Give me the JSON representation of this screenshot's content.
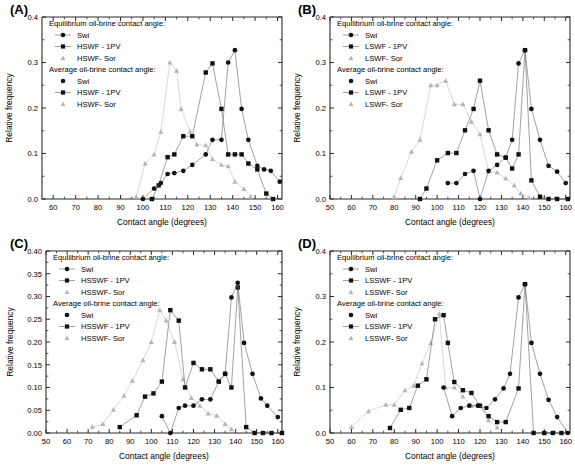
{
  "figure": {
    "panels": [
      "A",
      "B",
      "C",
      "D"
    ],
    "labels": {
      "A": "(A)",
      "B": "(B)",
      "C": "(C)",
      "D": "(D)"
    }
  },
  "chart_data": [
    {
      "panel": "(A)",
      "type": "line",
      "title": "",
      "xlabel": "Contact angle (degrees)",
      "ylabel": "Relative frequency",
      "xlim": [
        55,
        162
      ],
      "ylim": [
        0.0,
        0.4
      ],
      "xticks": [
        60,
        70,
        80,
        90,
        100,
        110,
        120,
        130,
        140,
        150,
        160
      ],
      "yticks": [
        0.0,
        0.1,
        0.2,
        0.3,
        0.4
      ],
      "ytick_labels": [
        "0.0",
        "0.1",
        "0.2",
        "0.3",
        "0.4"
      ],
      "grid": false,
      "legend_position": "upper-left",
      "legend_groups": [
        {
          "heading": "Equilibrium oil-brine contact angle:",
          "entries": [
            {
              "label": "Swi",
              "marker": "circle",
              "color": "#111111",
              "line": true
            },
            {
              "label": "HSWF - 1PV",
              "marker": "square",
              "color": "#111111",
              "line": true
            },
            {
              "label": "HSWF- Sor",
              "marker": "triangle",
              "color": "#b5b5b5",
              "line": false
            }
          ]
        },
        {
          "heading": "Average oil-brine contact angle:",
          "entries": [
            {
              "label": "Swi",
              "marker": "circle",
              "color": "#111111",
              "line": false
            },
            {
              "label": "HSWF - 1PV",
              "marker": "square",
              "color": "#111111",
              "line": true
            },
            {
              "label": "HSWF- Sor",
              "marker": "triangle",
              "color": "#b5b5b5",
              "line": false
            }
          ]
        }
      ],
      "series": [
        {
          "name": "Swi",
          "marker": "circle",
          "color": "#111111",
          "x": [
            100,
            105,
            108,
            111,
            114,
            118,
            122,
            128,
            131,
            135,
            138,
            141,
            144,
            147,
            151,
            154,
            157,
            161
          ],
          "values": [
            0.0,
            0.023,
            0.035,
            0.055,
            0.057,
            0.062,
            0.075,
            0.098,
            0.13,
            0.13,
            0.3,
            0.327,
            0.198,
            0.13,
            0.073,
            0.065,
            0.062,
            0.038
          ]
        },
        {
          "name": "HSWF - 1PV",
          "marker": "square",
          "color": "#111111",
          "x": [
            104,
            107,
            111,
            114,
            118,
            122,
            128,
            131,
            135,
            138,
            141,
            144,
            147,
            151,
            155,
            158
          ],
          "values": [
            0.0,
            0.03,
            0.092,
            0.098,
            0.138,
            0.138,
            0.278,
            0.298,
            0.198,
            0.098,
            0.098,
            0.098,
            0.078,
            0.065,
            0.012,
            0.0
          ]
        },
        {
          "name": "HSWF- Sor",
          "marker": "triangle",
          "color": "#b5b5b5",
          "x": [
            97,
            101,
            105,
            108,
            112,
            115,
            117,
            121,
            124,
            128,
            131,
            135,
            138,
            141,
            145,
            148
          ],
          "values": [
            0.005,
            0.078,
            0.098,
            0.148,
            0.3,
            0.282,
            0.198,
            0.148,
            0.12,
            0.118,
            0.088,
            0.075,
            0.072,
            0.038,
            0.022,
            0.005
          ]
        }
      ]
    },
    {
      "panel": "(B)",
      "type": "line",
      "title": "",
      "xlabel": "Contact angle (degrees)",
      "ylabel": "Relative frequency",
      "xlim": [
        50,
        162
      ],
      "ylim": [
        0.0,
        0.4
      ],
      "xticks": [
        50,
        60,
        70,
        80,
        90,
        100,
        110,
        120,
        130,
        140,
        150,
        160
      ],
      "yticks": [
        0.0,
        0.1,
        0.2,
        0.3,
        0.4
      ],
      "ytick_labels": [
        "0.0",
        "0.1",
        "0.2",
        "0.3",
        "0.4"
      ],
      "grid": false,
      "legend_position": "upper-left",
      "legend_groups": [
        {
          "heading": "Equilibrium oil-brine contact angle:",
          "entries": [
            {
              "label": "Swi",
              "marker": "circle",
              "color": "#111111",
              "line": true
            },
            {
              "label": "LSWF - 1PV",
              "marker": "square",
              "color": "#111111",
              "line": true
            },
            {
              "label": "LSWF- Sor",
              "marker": "triangle",
              "color": "#b5b5b5",
              "line": false
            }
          ]
        },
        {
          "heading": "Average oil-brine contact angle:",
          "entries": [
            {
              "label": "Swi",
              "marker": "circle",
              "color": "#111111",
              "line": false
            },
            {
              "label": "LSWF - 1PV",
              "marker": "square",
              "color": "#111111",
              "line": true
            },
            {
              "label": "LSWF- Sor",
              "marker": "triangle",
              "color": "#b5b5b5",
              "line": false
            }
          ]
        }
      ],
      "series": [
        {
          "name": "Swi",
          "marker": "circle",
          "color": "#111111",
          "x": [
            105,
            109,
            113,
            117,
            120,
            124,
            128,
            132,
            135,
            138,
            141,
            144,
            148,
            152,
            156,
            160
          ],
          "values": [
            0.035,
            0.035,
            0.055,
            0.062,
            0.0,
            0.062,
            0.075,
            0.091,
            0.13,
            0.298,
            0.327,
            0.198,
            0.13,
            0.073,
            0.06,
            0.035
          ]
        },
        {
          "name": "LSWF - 1PV",
          "marker": "square",
          "color": "#111111",
          "x": [
            92,
            95,
            100,
            105,
            109,
            113,
            117,
            120,
            124,
            128,
            132,
            135,
            138,
            141,
            144,
            148,
            152,
            156,
            161
          ],
          "values": [
            0.0,
            0.023,
            0.085,
            0.101,
            0.101,
            0.151,
            0.198,
            0.26,
            0.151,
            0.098,
            0.091,
            0.067,
            0.098,
            0.327,
            0.041,
            0.005,
            0.0,
            0.0,
            0.0
          ]
        },
        {
          "name": "LSWF- Sor",
          "marker": "triangle",
          "color": "#b5b5b5",
          "x": [
            80,
            83,
            88,
            92,
            97,
            100,
            104,
            108,
            112,
            116,
            120,
            124,
            128,
            132,
            136,
            139,
            143
          ],
          "values": [
            0.004,
            0.046,
            0.104,
            0.13,
            0.25,
            0.25,
            0.26,
            0.208,
            0.208,
            0.17,
            0.142,
            0.06,
            0.058,
            0.045,
            0.03,
            0.012,
            0.002
          ]
        }
      ]
    },
    {
      "panel": "(C)",
      "type": "line",
      "title": "",
      "xlabel": "Contact angle (degrees)",
      "ylabel": "Relative frequency",
      "xlim": [
        50,
        162
      ],
      "ylim": [
        0.0,
        0.4
      ],
      "xticks": [
        50,
        60,
        70,
        80,
        90,
        100,
        110,
        120,
        130,
        140,
        150,
        160
      ],
      "yticks": [
        0.0,
        0.05,
        0.1,
        0.15,
        0.2,
        0.25,
        0.3,
        0.35,
        0.4
      ],
      "ytick_labels": [
        "0.00",
        "0.05",
        "0.10",
        "0.15",
        "0.20",
        "0.25",
        "0.30",
        "0.35",
        "0.40"
      ],
      "grid": false,
      "legend_position": "upper-left",
      "legend_groups": [
        {
          "heading": "Equilibrium oil-brine contact angle:",
          "entries": [
            {
              "label": "Swi",
              "marker": "circle",
              "color": "#111111",
              "line": true
            },
            {
              "label": "HSSWF - 1PV",
              "marker": "square",
              "color": "#111111",
              "line": true
            },
            {
              "label": "HSSWF- Sor",
              "marker": "triangle",
              "color": "#b5b5b5",
              "line": false
            }
          ]
        },
        {
          "heading": "Average oil-brine contact angle:",
          "entries": [
            {
              "label": "Swi",
              "marker": "circle",
              "color": "#111111",
              "line": false
            },
            {
              "label": "HSSWF - 1PV",
              "marker": "square",
              "color": "#111111",
              "line": true
            },
            {
              "label": "HSSWF- Sor",
              "marker": "triangle",
              "color": "#b5b5b5",
              "line": false
            }
          ]
        }
      ],
      "series": [
        {
          "name": "Swi",
          "marker": "circle",
          "color": "#111111",
          "x": [
            105,
            109,
            113,
            116,
            120,
            124,
            128,
            132,
            135,
            138,
            141,
            144,
            148,
            152,
            155,
            160
          ],
          "values": [
            0.037,
            0.0,
            0.055,
            0.06,
            0.06,
            0.074,
            0.074,
            0.113,
            0.13,
            0.298,
            0.33,
            0.198,
            0.13,
            0.076,
            0.06,
            0.035
          ]
        },
        {
          "name": "HSSWF - 1PV",
          "marker": "square",
          "color": "#111111",
          "x": [
            85,
            93,
            97,
            101,
            105,
            109,
            113,
            116,
            120,
            124,
            128,
            132,
            135,
            138,
            141,
            145,
            149,
            153,
            157,
            162
          ],
          "values": [
            0.013,
            0.039,
            0.08,
            0.087,
            0.113,
            0.27,
            0.247,
            0.1,
            0.154,
            0.14,
            0.14,
            0.113,
            0.13,
            0.1,
            0.32,
            0.013,
            0.0,
            0.0,
            0.0,
            0.0
          ]
        },
        {
          "name": "HSSWF- Sor",
          "marker": "triangle",
          "color": "#b5b5b5",
          "x": [
            72,
            77,
            82,
            87,
            91,
            96,
            100,
            104,
            107,
            111,
            115,
            119,
            123,
            127,
            131,
            135,
            138
          ],
          "values": [
            0.013,
            0.02,
            0.051,
            0.082,
            0.115,
            0.16,
            0.2,
            0.27,
            0.247,
            0.2,
            0.118,
            0.077,
            0.06,
            0.043,
            0.038,
            0.02,
            0.008
          ]
        }
      ]
    },
    {
      "panel": "(D)",
      "type": "line",
      "title": "",
      "xlabel": "Contact angle (degrees)",
      "ylabel": "Relative frequency",
      "xlim": [
        50,
        162
      ],
      "ylim": [
        0.0,
        0.4
      ],
      "xticks": [
        50,
        60,
        70,
        80,
        90,
        100,
        110,
        120,
        130,
        140,
        150,
        160
      ],
      "yticks": [
        0.0,
        0.1,
        0.2,
        0.3,
        0.4
      ],
      "ytick_labels": [
        "0.0",
        "0.1",
        "0.2",
        "0.3",
        "0.4"
      ],
      "grid": false,
      "legend_position": "upper-left",
      "legend_groups": [
        {
          "heading": "Equilibrium oil-brine contact angle:",
          "entries": [
            {
              "label": "Swi",
              "marker": "circle",
              "color": "#111111",
              "line": true
            },
            {
              "label": "LSSWF - 1PV",
              "marker": "square",
              "color": "#111111",
              "line": true
            },
            {
              "label": "LSSWF- Sor",
              "marker": "triangle",
              "color": "#b5b5b5",
              "line": false
            }
          ]
        },
        {
          "heading": "Average oil-brine contact angle:",
          "entries": [
            {
              "label": "Swi",
              "marker": "circle",
              "color": "#111111",
              "line": false
            },
            {
              "label": "LSSWF - 1PV",
              "marker": "square",
              "color": "#111111",
              "line": true
            },
            {
              "label": "LSSWF- Sor",
              "marker": "triangle",
              "color": "#b5b5b5",
              "line": false
            }
          ]
        }
      ],
      "series": [
        {
          "name": "Swi",
          "marker": "circle",
          "color": "#111111",
          "x": [
            103,
            107,
            111,
            115,
            119,
            123,
            127,
            131,
            134,
            138,
            141,
            144,
            148,
            152,
            156,
            161
          ],
          "values": [
            0.1,
            0.037,
            0.055,
            0.06,
            0.06,
            0.055,
            0.074,
            0.098,
            0.13,
            0.298,
            0.327,
            0.198,
            0.13,
            0.073,
            0.035,
            0.0
          ]
        },
        {
          "name": "LSSWF - 1PV",
          "marker": "square",
          "color": "#111111",
          "x": [
            78,
            83,
            87,
            91,
            95,
            99,
            103,
            105,
            108,
            112,
            116,
            120,
            124,
            128,
            132,
            138,
            141,
            145,
            150,
            154,
            158
          ],
          "values": [
            0.011,
            0.051,
            0.055,
            0.104,
            0.118,
            0.25,
            0.259,
            0.198,
            0.112,
            0.094,
            0.088,
            0.06,
            0.037,
            0.024,
            0.024,
            0.098,
            0.327,
            0.0,
            0.0,
            0.0,
            0.0
          ]
        },
        {
          "name": "LSSWF- Sor",
          "marker": "triangle",
          "color": "#b5b5b5",
          "x": [
            60,
            68,
            76,
            80,
            85,
            89,
            93,
            97,
            101,
            104,
            108,
            112,
            116,
            120,
            124,
            128
          ],
          "values": [
            0.013,
            0.048,
            0.062,
            0.062,
            0.094,
            0.104,
            0.153,
            0.198,
            0.262,
            0.1,
            0.1,
            0.08,
            0.06,
            0.06,
            0.028,
            0.012
          ]
        }
      ]
    }
  ]
}
